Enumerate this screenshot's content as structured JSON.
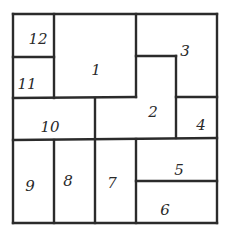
{
  "diagram": {
    "type": "rectangle-partition",
    "stroke_color": "#2b2b2b",
    "background": "#ffffff",
    "outer": {
      "x1": 13,
      "y1": 14,
      "x2": 217,
      "y2": 223
    },
    "regions": [
      {
        "id": "1",
        "label": "1",
        "lx": 96,
        "ly": 70
      },
      {
        "id": "2",
        "label": "2",
        "lx": 153,
        "ly": 112
      },
      {
        "id": "3",
        "label": "3",
        "lx": 185,
        "ly": 51
      },
      {
        "id": "4",
        "label": "4",
        "lx": 201,
        "ly": 125
      },
      {
        "id": "5",
        "label": "5",
        "lx": 179,
        "ly": 170
      },
      {
        "id": "6",
        "label": "6",
        "lx": 165,
        "ly": 210
      },
      {
        "id": "7",
        "label": "7",
        "lx": 112,
        "ly": 183
      },
      {
        "id": "8",
        "label": "8",
        "lx": 68,
        "ly": 181
      },
      {
        "id": "9",
        "label": "9",
        "lx": 30,
        "ly": 186
      },
      {
        "id": "10",
        "label": "10",
        "lx": 50,
        "ly": 127
      },
      {
        "id": "11",
        "label": "11",
        "lx": 27,
        "ly": 84
      },
      {
        "id": "12",
        "label": "12",
        "lx": 38,
        "ly": 39
      }
    ],
    "lines": [
      {
        "x1": 13,
        "y1": 14,
        "x2": 217,
        "y2": 14
      },
      {
        "x1": 13,
        "y1": 223,
        "x2": 217,
        "y2": 223
      },
      {
        "x1": 13,
        "y1": 14,
        "x2": 13,
        "y2": 223
      },
      {
        "x1": 217,
        "y1": 14,
        "x2": 217,
        "y2": 223
      },
      {
        "x1": 54,
        "y1": 14,
        "x2": 54,
        "y2": 98
      },
      {
        "x1": 13,
        "y1": 57,
        "x2": 54,
        "y2": 57
      },
      {
        "x1": 136,
        "y1": 14,
        "x2": 136,
        "y2": 97
      },
      {
        "x1": 13,
        "y1": 98,
        "x2": 136,
        "y2": 97
      },
      {
        "x1": 136,
        "y1": 56,
        "x2": 176,
        "y2": 56
      },
      {
        "x1": 176,
        "y1": 56,
        "x2": 176,
        "y2": 138
      },
      {
        "x1": 176,
        "y1": 97,
        "x2": 217,
        "y2": 97
      },
      {
        "x1": 95,
        "y1": 98,
        "x2": 95,
        "y2": 223
      },
      {
        "x1": 13,
        "y1": 140,
        "x2": 217,
        "y2": 138
      },
      {
        "x1": 54,
        "y1": 140,
        "x2": 54,
        "y2": 223
      },
      {
        "x1": 136,
        "y1": 139,
        "x2": 136,
        "y2": 223
      },
      {
        "x1": 136,
        "y1": 181,
        "x2": 217,
        "y2": 181
      }
    ]
  }
}
